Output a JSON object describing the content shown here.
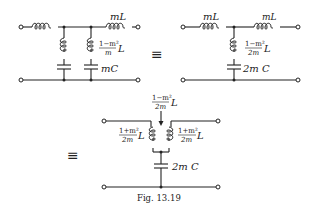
{
  "figure": {
    "caption": "Fig. 13.19",
    "equivalence_symbol": "≡"
  },
  "circuit_a": {
    "series_left_label": "",
    "series_right_label": "mL",
    "shunt_branch_1_label": "",
    "shunt_branch_2_inductor_numerator": "1−m²",
    "shunt_branch_2_inductor_denominator": "m",
    "shunt_branch_2_inductor_suffix": "L",
    "shunt_branch_2_capacitor_label": "mC"
  },
  "circuit_b": {
    "series_left_label": "mL",
    "series_right_label": "mL",
    "shunt_inductor_numerator": "1−m²",
    "shunt_inductor_denominator": "2m",
    "shunt_inductor_suffix": "L",
    "shunt_capacitor_label": "2m C"
  },
  "circuit_c": {
    "mutual_numerator": "1−m²",
    "mutual_denominator": "2m",
    "mutual_suffix": "L",
    "left_coil_numerator": "1+m²",
    "left_coil_denominator": "2m",
    "left_coil_suffix": "L",
    "right_coil_numerator": "1+m²",
    "right_coil_denominator": "2m",
    "right_coil_suffix": "L",
    "shunt_capacitor_label": "2m C"
  }
}
